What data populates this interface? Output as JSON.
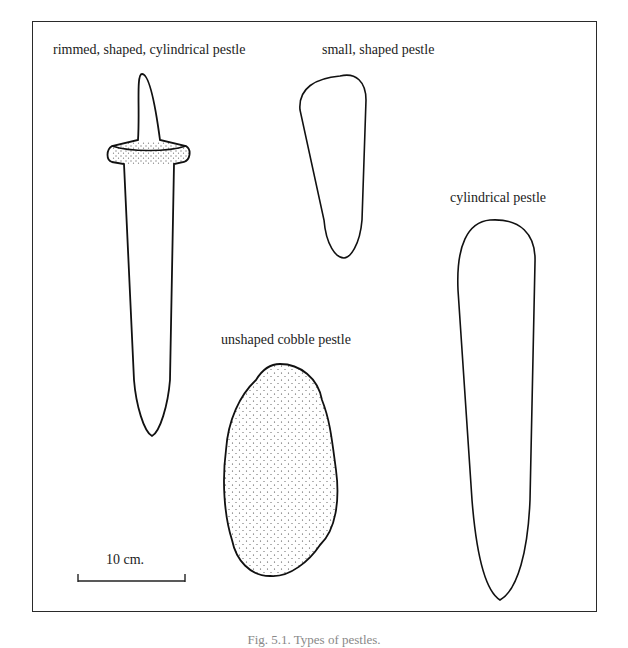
{
  "figure": {
    "labels": {
      "rimmed": "rimmed, shaped, cylindrical pestle",
      "small": "small, shaped pestle",
      "cylindrical": "cylindrical pestle",
      "cobble": "unshaped cobble pestle"
    },
    "scale_bar": {
      "label": "10 cm."
    },
    "caption": "Fig. 5.1. Types of pestles."
  }
}
